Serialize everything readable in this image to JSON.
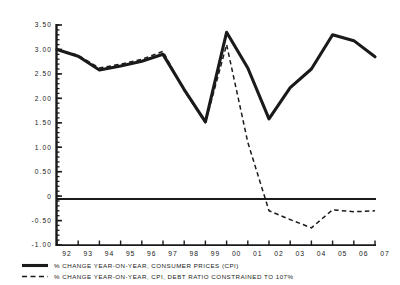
{
  "chart_data": {
    "type": "line",
    "title": "",
    "subtitle": "",
    "xlabel": "",
    "ylabel": "",
    "grid": false,
    "legend_position": "bottom-left",
    "x": [
      "92",
      "93",
      "94",
      "95",
      "96",
      "97",
      "98",
      "99",
      "00",
      "01",
      "02",
      "03",
      "04",
      "05",
      "06",
      "07"
    ],
    "categories": [
      "92",
      "93",
      "94",
      "95",
      "96",
      "97",
      "98",
      "99",
      "00",
      "01",
      "02",
      "03",
      "04",
      "05",
      "06",
      "07"
    ],
    "ylim": [
      -1.0,
      3.5
    ],
    "xlim": [
      0,
      15
    ],
    "yticks": [
      3.5,
      3.0,
      2.5,
      2.0,
      1.5,
      1.0,
      0.5,
      0,
      -0.5,
      -1.0
    ],
    "ytick_labels": [
      "3.50",
      "3.00",
      "2.50",
      "2.00",
      "1.50",
      "1.00",
      "0.50",
      "0",
      "-0.50",
      "-1.00"
    ],
    "zero_line": 0,
    "series": [
      {
        "name": "% CHANGE YEAR-ON-YEAR, CONSUMER PRICES (CPI)",
        "style": "solid",
        "color": "#1a1a1a",
        "values": [
          3.0,
          2.86,
          2.58,
          2.66,
          2.76,
          2.9,
          2.18,
          1.52,
          3.35,
          2.62,
          1.58,
          2.22,
          2.6,
          3.3,
          3.18,
          2.85
        ]
      },
      {
        "name": "% CHANGE YEAR-ON-YEAR, CPI, DEBT RATIO CONSTRAINED TO 107%",
        "style": "dashed",
        "color": "#1a1a1a",
        "values": [
          3.0,
          2.88,
          2.62,
          2.7,
          2.8,
          2.96,
          2.16,
          1.5,
          3.1,
          1.1,
          -0.3,
          -0.48,
          -0.65,
          -0.28,
          -0.32,
          -0.3
        ]
      }
    ]
  },
  "legend": {
    "items": [
      {
        "label": "% CHANGE YEAR-ON-YEAR, CONSUMER PRICES (CPI)",
        "style": "solid"
      },
      {
        "label": "% CHANGE YEAR-ON-YEAR, CPI, DEBT RATIO CONSTRAINED TO 107%",
        "style": "dashed"
      }
    ]
  }
}
